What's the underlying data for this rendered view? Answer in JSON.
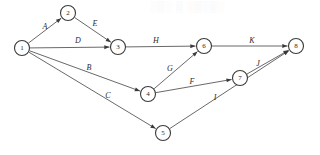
{
  "diagram": {
    "type": "directed-graph",
    "width": 320,
    "height": 155,
    "colors": {
      "background": "#ffffff",
      "edge": "#585858",
      "node_stroke": "#3a3a3a",
      "node_fill": "#ffffff",
      "text": "#2b2b2b",
      "watermark": "#f4f4f4"
    },
    "node_radius": 7.5,
    "nodes": [
      {
        "id": "1",
        "label": "1",
        "x": 22,
        "y": 48
      },
      {
        "id": "2",
        "label": "2",
        "x": 68,
        "y": 13
      },
      {
        "id": "3",
        "label": "3",
        "x": 118,
        "y": 47
      },
      {
        "id": "4",
        "label": "4",
        "x": 148,
        "y": 94
      },
      {
        "id": "5",
        "label": "5",
        "x": 163,
        "y": 133
      },
      {
        "id": "6",
        "label": "6",
        "x": 204,
        "y": 46
      },
      {
        "id": "7",
        "label": "7",
        "x": 240,
        "y": 78
      },
      {
        "id": "8",
        "label": "8",
        "x": 296,
        "y": 46
      }
    ],
    "edges": [
      {
        "id": "A",
        "label": "A",
        "from": "1",
        "to": "2",
        "label_x": 45,
        "label_y": 26
      },
      {
        "id": "E",
        "label": "E",
        "from": "2",
        "to": "3",
        "label_x": 95,
        "label_y": 23
      },
      {
        "id": "D",
        "label": "D",
        "from": "1",
        "to": "3",
        "label_x": 78,
        "label_y": 40
      },
      {
        "id": "H",
        "label": "H",
        "from": "3",
        "to": "6",
        "label_x": 156,
        "label_y": 40
      },
      {
        "id": "B",
        "label": "B",
        "from": "1",
        "to": "4",
        "label_x": 89,
        "label_y": 67
      },
      {
        "id": "C",
        "label": "C",
        "from": "1",
        "to": "5",
        "label_x": 108,
        "label_y": 95
      },
      {
        "id": "G",
        "label": "G",
        "from": "4",
        "to": "6",
        "label_x": 170,
        "label_y": 68
      },
      {
        "id": "F",
        "label": "F",
        "from": "4",
        "to": "7",
        "label_x": 192,
        "label_y": 81
      },
      {
        "id": "I",
        "label": "I",
        "from": "5",
        "to": "8",
        "label_x": 215,
        "label_y": 97
      },
      {
        "id": "K",
        "label": "K",
        "from": "6",
        "to": "8",
        "label_x": 252,
        "label_y": 40
      },
      {
        "id": "J",
        "label": "J",
        "from": "7",
        "to": "8",
        "label_x": 258,
        "label_y": 63
      }
    ],
    "watermark_text": "░▒░ ▒ ░▒░▒░"
  }
}
